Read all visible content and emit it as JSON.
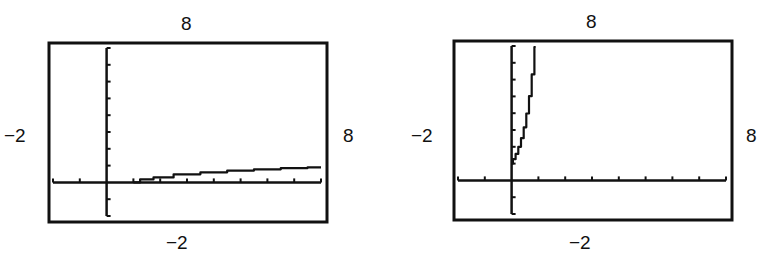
{
  "chart_data": [
    {
      "type": "line",
      "title": "",
      "xlabel": "",
      "ylabel": "",
      "window": {
        "xmin": -2,
        "xmax": 8,
        "ymin": -2,
        "ymax": 8,
        "xscl": 1,
        "yscl": 1
      },
      "xlim": [
        -2,
        8
      ],
      "ylim": [
        -2,
        8
      ],
      "grid": false,
      "legend": null,
      "labels": {
        "top": "8",
        "bottom": "−2",
        "left": "−2",
        "right": "8"
      },
      "series": [
        {
          "name": "y = log x",
          "x": [
            1,
            1.5,
            2,
            3,
            4,
            5,
            6,
            7,
            8
          ],
          "y": [
            0,
            0.18,
            0.3,
            0.48,
            0.6,
            0.7,
            0.78,
            0.85,
            0.9
          ]
        }
      ]
    },
    {
      "type": "line",
      "title": "",
      "xlabel": "",
      "ylabel": "",
      "window": {
        "xmin": -2,
        "xmax": 8,
        "ymin": -2,
        "ymax": 8,
        "xscl": 1,
        "yscl": 1
      },
      "xlim": [
        -2,
        8
      ],
      "ylim": [
        -2,
        8
      ],
      "grid": false,
      "legend": null,
      "labels": {
        "top": "8",
        "bottom": "−2",
        "left": "−2",
        "right": "8"
      },
      "series": [
        {
          "name": "y = 10^x",
          "x": [
            0,
            0.1,
            0.2,
            0.3,
            0.4,
            0.5,
            0.6,
            0.7,
            0.8,
            0.9
          ],
          "y": [
            1,
            1.26,
            1.58,
            2.0,
            2.51,
            3.16,
            3.98,
            5.01,
            6.31,
            7.94
          ]
        }
      ]
    }
  ]
}
